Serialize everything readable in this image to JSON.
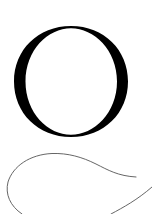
{
  "artwork": {
    "letter": "O",
    "colors": {
      "background": "#ffffff",
      "letter": "#000000",
      "swash": "#555555"
    }
  }
}
